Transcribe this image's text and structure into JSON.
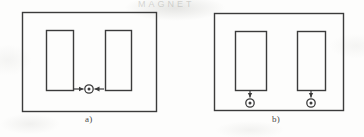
{
  "document": {
    "kind": "scanned-figure",
    "background_color": "#fdfdfc",
    "ink_color": "#3b3b3b",
    "width": 364,
    "height": 137,
    "watermark_text": "MAGNET"
  },
  "figures": [
    {
      "id": "a",
      "caption": "a)",
      "outer_rect": {
        "x": 22,
        "y": 12,
        "w": 134,
        "h": 99
      },
      "inner_rects": [
        {
          "name": "left-pole-block",
          "x": 46,
          "y": 30,
          "w": 27,
          "h": 60
        },
        {
          "name": "right-pole-block",
          "x": 105,
          "y": 30,
          "w": 26,
          "h": 60
        }
      ],
      "markers": [
        {
          "name": "current-out-of-page-marker",
          "symbol": "circled-dot",
          "x": 89,
          "y": 89,
          "outer_r": 4.2,
          "inner_r": 1.5
        }
      ],
      "arrows": [
        {
          "name": "flux-arrow-from-left",
          "x1": 73,
          "y1": 89,
          "x2": 84,
          "y2": 89,
          "direction": "right"
        },
        {
          "name": "flux-arrow-from-right",
          "x1": 105,
          "y1": 89,
          "x2": 94,
          "y2": 89,
          "direction": "left"
        }
      ]
    },
    {
      "id": "b",
      "caption": "b)",
      "outer_rect": {
        "x": 214,
        "y": 13,
        "w": 129,
        "h": 97
      },
      "inner_rects": [
        {
          "name": "left-pole-block",
          "x": 235,
          "y": 31,
          "w": 31,
          "h": 59
        },
        {
          "name": "right-pole-block",
          "x": 297,
          "y": 31,
          "w": 28,
          "h": 59
        }
      ],
      "markers": [
        {
          "name": "current-out-of-page-marker-left",
          "symbol": "circled-dot",
          "x": 250,
          "y": 103,
          "outer_r": 4.2,
          "inner_r": 1.5
        },
        {
          "name": "current-out-of-page-marker-right",
          "symbol": "circled-dot",
          "x": 311,
          "y": 103,
          "outer_r": 4.2,
          "inner_r": 1.5
        }
      ],
      "arrows": [
        {
          "name": "flux-arrow-left-down",
          "x1": 250,
          "y1": 90,
          "x2": 250,
          "y2": 98,
          "direction": "down"
        },
        {
          "name": "flux-arrow-right-down",
          "x1": 311,
          "y1": 90,
          "x2": 311,
          "y2": 98,
          "direction": "down"
        }
      ]
    }
  ]
}
